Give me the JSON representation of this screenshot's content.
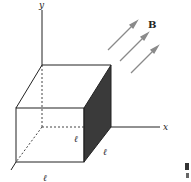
{
  "diagram": {
    "type": "3d-cube-in-magnetic-field",
    "axes": {
      "x_label": "x",
      "y_label": "y"
    },
    "field": {
      "label": "B",
      "arrow_count": 3,
      "arrow_color": "#8a8a8a"
    },
    "cube": {
      "edge_label": "ℓ",
      "edge_labels": [
        {
          "label": "ℓ",
          "position": "bottom-front-edge-near-origin"
        },
        {
          "label": "ℓ",
          "position": "bottom-right-depth-edge"
        },
        {
          "label": "ℓ",
          "position": "bottom-front-edge"
        }
      ],
      "shaded_face": "right (+x) face",
      "shaded_face_color": "#3a3a3a",
      "edge_color": "#222222"
    },
    "side_fragment": {
      "visible": true,
      "description": "partial glyph cut off at right edge"
    }
  }
}
